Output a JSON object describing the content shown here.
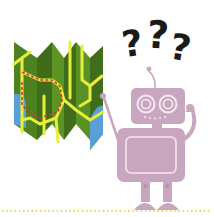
{
  "illustration": {
    "description": "Confused robot holding a folded map with question marks above its head",
    "question_marks": [
      "?",
      "?",
      "?"
    ],
    "colors": {
      "map_green_dark": "#3f6b1e",
      "map_green": "#5a8f23",
      "map_green_light": "#6ea52b",
      "road_yellow": "#e6ef3a",
      "water_blue": "#5aa0d8",
      "route_red": "#d9362a",
      "robot_mauve": "#c9a6bf",
      "robot_line": "#f4e9f1",
      "ground_dots": "#e8dc5a",
      "text_dark": "#1a1a1a"
    }
  }
}
